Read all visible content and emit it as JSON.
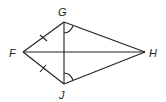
{
  "diagram": {
    "type": "kite",
    "stroke_color": "#231f20",
    "points": {
      "F": {
        "label": "F",
        "x": 23,
        "y": 52
      },
      "G": {
        "label": "G",
        "x": 64,
        "y": 22
      },
      "H": {
        "label": "H",
        "x": 145,
        "y": 52
      },
      "J": {
        "label": "J",
        "x": 64,
        "y": 84
      }
    },
    "segments": [
      "FG",
      "GH",
      "HJ",
      "JF",
      "FH",
      "GJ"
    ],
    "congruence_marks": [
      "FG",
      "FJ"
    ],
    "angle_marks": [
      "FGJ-side at G toward H",
      "GJH at J"
    ]
  }
}
